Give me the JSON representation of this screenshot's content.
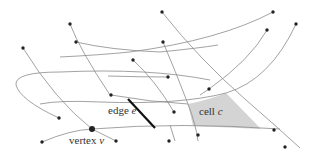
{
  "diagram": {
    "labels": {
      "edge": {
        "word": "edge",
        "var": "e"
      },
      "cell": {
        "word": "cell",
        "var": "c"
      },
      "vertex": {
        "word": "vertex",
        "var": "v"
      }
    },
    "colors": {
      "curve": "#8a8a8a",
      "point": "#222222",
      "edge_highlight": "#111111",
      "cell_fill": "#d4d4d4"
    }
  }
}
